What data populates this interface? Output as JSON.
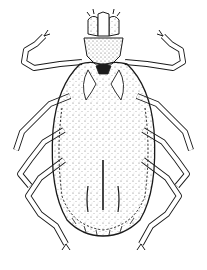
{
  "image": {
    "subject": "tick",
    "style": "black-and-white stippled scientific illustration",
    "view": "dorsal",
    "background_color": "#ffffff",
    "ink_color": "#1a1a1a",
    "leg_count": 8
  }
}
